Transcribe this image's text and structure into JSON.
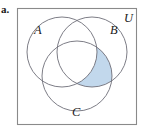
{
  "figure": {
    "item_label": "a.",
    "universe_label": "U",
    "frame": {
      "x": 17,
      "y": 8,
      "width": 119,
      "height": 116,
      "stroke_color": "#8a8a8a",
      "fill_color": "#ffffff",
      "stroke_width": 1.1
    },
    "circle_stroke_color": "#6e6e78",
    "circle_stroke_width": 0.9,
    "shade_fill_color": "#c2d8ec",
    "shade_stroke_color": "#6e6e78",
    "sets": [
      {
        "name": "set-a",
        "label": "A",
        "cx": 62,
        "cy": 52,
        "r": 35,
        "label_x": 34,
        "label_y": 34
      },
      {
        "name": "set-b",
        "label": "B",
        "cx": 92,
        "cy": 52,
        "r": 35,
        "label_x": 110,
        "label_y": 34
      },
      {
        "name": "set-c",
        "label": "C",
        "cx": 77,
        "cy": 76,
        "r": 35,
        "label_x": 72,
        "label_y": 116
      }
    ],
    "universe_label_x": 124,
    "universe_label_y": 22,
    "shaded_region": {
      "name": "b-intersect-c-minus-a",
      "description": "B and C intersection excluding A",
      "fill": "#c2d8ec"
    }
  }
}
